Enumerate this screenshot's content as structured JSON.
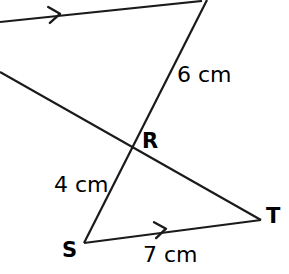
{
  "figure": {
    "background_color": "#ffffff",
    "stroke_color": "#1a1a1a",
    "width": 289,
    "height": 274
  },
  "vertices": [
    {
      "name": "R",
      "label": "R",
      "x": 132,
      "y": 147,
      "label_x": 142,
      "label_y": 131
    },
    {
      "name": "S",
      "label": "S",
      "x": 84,
      "y": 243,
      "label_x": 62,
      "label_y": 240
    },
    {
      "name": "T",
      "label": "T",
      "x": 261,
      "y": 220,
      "label_x": 266,
      "label_y": 206
    }
  ],
  "measures": [
    {
      "name": "segment-upper",
      "label": "6 cm",
      "x": 177,
      "y": 64
    },
    {
      "name": "segment-sr",
      "label": "4 cm",
      "x": 54,
      "y": 174
    },
    {
      "name": "segment-st",
      "label": "7 cm",
      "x": 143,
      "y": 244
    }
  ],
  "segments": [
    {
      "name": "top-parallel-line",
      "x1": 0,
      "y1": 22,
      "x2": 202,
      "y2": 1,
      "width": 2.2
    },
    {
      "name": "left-transversal-line",
      "x1": 0,
      "y1": 72,
      "x2": 261,
      "y2": 220,
      "width": 2.2
    },
    {
      "name": "steep-line-through-r",
      "x1": 207,
      "y1": 0,
      "x2": 84,
      "y2": 243,
      "width": 2.2
    },
    {
      "name": "base-line-st",
      "x1": 84,
      "y1": 243,
      "x2": 261,
      "y2": 220,
      "width": 2.2
    }
  ],
  "arrow_marks": [
    {
      "name": "parallel-arrow-top",
      "x": 58,
      "y": 14,
      "angle": -6
    },
    {
      "name": "parallel-arrow-base",
      "x": 164,
      "y": 229,
      "angle": -7.4
    }
  ]
}
